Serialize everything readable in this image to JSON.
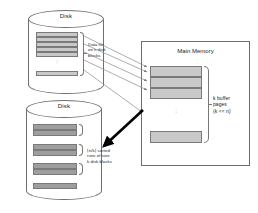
{
  "figure": {
    "type": "diagram",
    "background": "#ffffff"
  },
  "colors": {
    "block_light": "#c9c9c9",
    "block_dark": "#9e9e9e",
    "outline": "#6e6e6e",
    "thin_arrow": "#8a8a8a",
    "thick_arrow": "#000000",
    "text": "#222222"
  },
  "disks": [
    {
      "id": "source-disk",
      "label": "Disk",
      "caption": "Data file on n disk blocks",
      "caption_lines": [
        "Data file",
        "on n disk",
        "blocks"
      ],
      "blocks_contiguous": 5,
      "has_ellipsis": true,
      "blocks_after_ellipsis": 1,
      "block_shade": "light"
    },
    {
      "id": "output-disk",
      "label": "Disk",
      "caption": "⌈n/k⌉ sorted runs of size k disk blocks",
      "caption_lines": [
        "⌈n/k⌉ sorted",
        "runs of size",
        "k disk blocks"
      ],
      "run_groups": 3,
      "blocks_per_run": 2,
      "trailing_blocks": 1,
      "block_shade": "dark"
    }
  ],
  "memory": {
    "id": "main-memory",
    "title": "Main Memory",
    "caption": "k buffer pages (k << n)",
    "caption_lines": [
      "k buffer",
      "pages",
      "(k << n)"
    ],
    "buffer_blocks_contiguous": 3,
    "has_ellipsis": true,
    "blocks_after_ellipsis": 1
  },
  "arrows": {
    "read": {
      "label": "read blocks from disk into buffer pages",
      "count": 5,
      "style": "thin",
      "direction": "disk-to-memory"
    },
    "write": {
      "label": "write sorted run back to disk",
      "count": 1,
      "style": "thick",
      "direction": "memory-to-disk"
    }
  }
}
